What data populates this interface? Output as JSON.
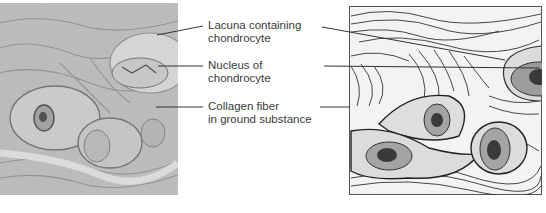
{
  "figure": {
    "left_panel": {
      "kind": "light-micrograph",
      "subject": "cartilage tissue with chondrocytes in lacunae"
    },
    "right_panel": {
      "kind": "line-drawing",
      "subject": "schematic of cartilage with chondrocytes and collagen fibers"
    },
    "labels": [
      {
        "id": "lacuna",
        "line1": "Lacuna containing",
        "line2": "chondrocyte"
      },
      {
        "id": "nucleus",
        "line1": "Nucleus of",
        "line2": "chondrocyte"
      },
      {
        "id": "collagen",
        "line1": "Collagen fiber",
        "line2": "in ground substance"
      }
    ]
  },
  "colors": {
    "micrograph_bg": "#c9c9c9",
    "micrograph_dark": "#8a8a8a",
    "drawing_bg": "#f2f2f2",
    "cell_fill": "#b8b8b8",
    "lacuna_fill": "#dcdcdc",
    "nucleus_fill": "#3a3a3a",
    "line": "#333333",
    "text": "#3a3a3a"
  }
}
